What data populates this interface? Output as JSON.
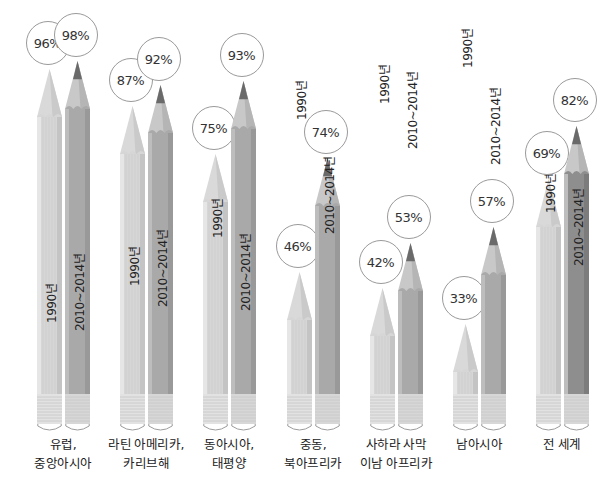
{
  "chart_data": {
    "type": "bar",
    "style": "pictogram-pencils",
    "title": "",
    "xlabel": "",
    "ylabel": "",
    "ylim": [
      0,
      100
    ],
    "categories": [
      "유럽, 중앙아시아",
      "라틴 아메리카, 카리브해",
      "동아시아, 태평양",
      "중동, 북아프리카",
      "사하라 사막 이남 아프리카",
      "남아시아",
      "전 세계"
    ],
    "category_lines": [
      [
        "유럽,",
        "중앙아시아"
      ],
      [
        "라틴 아메리카,",
        "카리브해"
      ],
      [
        "동아시아,",
        "태평양"
      ],
      [
        "중동,",
        "북아프리카"
      ],
      [
        "사하라 사막",
        "이남 아프리카"
      ],
      [
        "남아시아"
      ],
      [
        "전 세계"
      ]
    ],
    "series": [
      {
        "name": "1990년",
        "values": [
          96,
          87,
          75,
          46,
          42,
          33,
          69
        ]
      },
      {
        "name": "2010~2014년",
        "values": [
          98,
          92,
          93,
          74,
          53,
          57,
          82
        ]
      }
    ],
    "value_labels": [
      [
        "96%",
        "98%"
      ],
      [
        "87%",
        "92%"
      ],
      [
        "75%",
        "93%"
      ],
      [
        "46%",
        "74%"
      ],
      [
        "42%",
        "53%"
      ],
      [
        "33%",
        "57%"
      ],
      [
        "69%",
        "82%"
      ]
    ],
    "legend": "none (series names printed on pencils)",
    "grid": false
  },
  "colors": {
    "light_body": "#d6d6d6",
    "light_edge": "#c4c4c4",
    "dark_body": "#a9a9a9",
    "dark_edge": "#999999",
    "world_dark_body": "#8e8e8e",
    "lead": "#6a6a6a",
    "wood": "#cfcfcf",
    "bubble_border": "#9a9a9a"
  }
}
